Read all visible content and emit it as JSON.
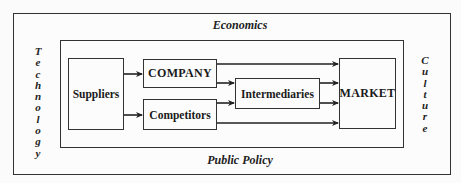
{
  "diagram": {
    "environment": {
      "top": "Economics",
      "bottom": "Public Policy",
      "left": "Technology",
      "right": "Culture"
    },
    "nodes": {
      "suppliers": "Suppliers",
      "company": "COMPANY",
      "competitors": "Competitors",
      "intermediaries": "Intermediaries",
      "market": "MARKET"
    },
    "edges": [
      {
        "from": "Suppliers",
        "to": "COMPANY"
      },
      {
        "from": "Suppliers",
        "to": "Competitors"
      },
      {
        "from": "COMPANY",
        "to": "MARKET"
      },
      {
        "from": "COMPANY",
        "to": "Intermediaries"
      },
      {
        "from": "Competitors",
        "to": "Intermediaries"
      },
      {
        "from": "Competitors",
        "to": "MARKET"
      },
      {
        "from": "Intermediaries",
        "to": "MARKET"
      },
      {
        "from": "Intermediaries",
        "to": "MARKET"
      }
    ]
  }
}
